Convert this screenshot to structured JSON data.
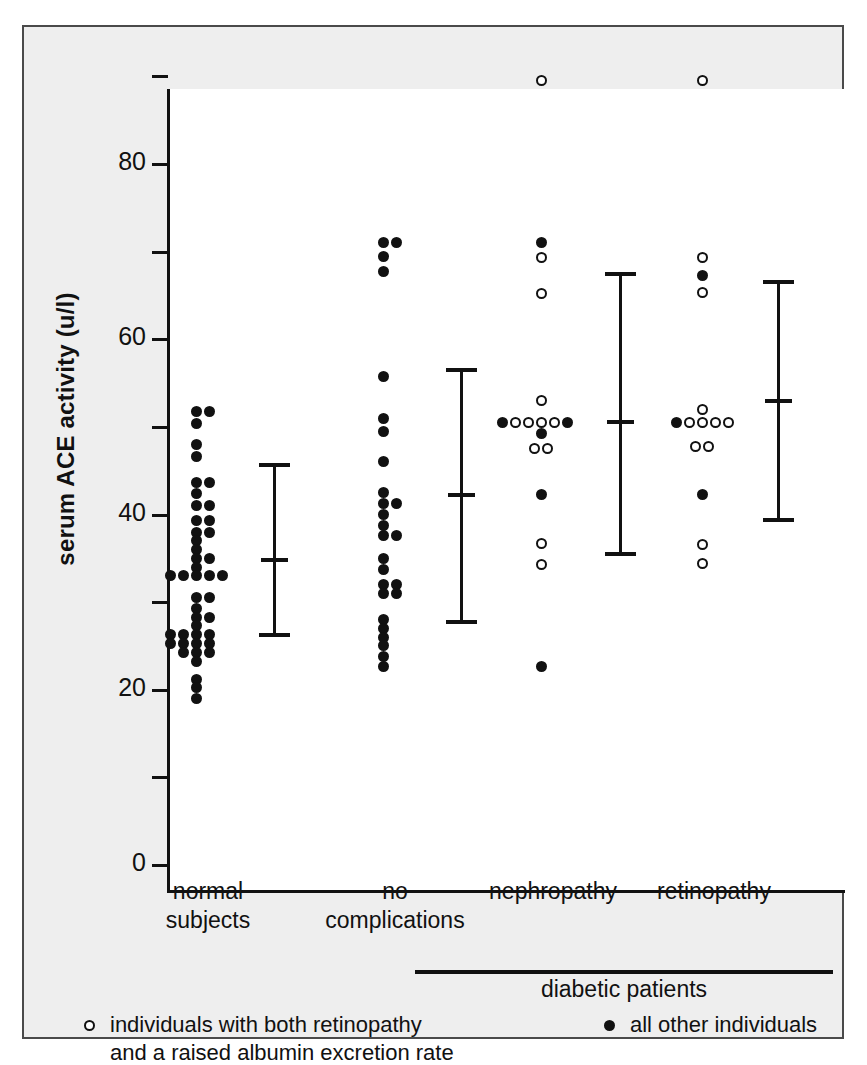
{
  "chart_data": {
    "type": "scatter",
    "title": "",
    "xlabel": "",
    "ylabel": "serum ACE activity (u/l)",
    "ylim": [
      0,
      90
    ],
    "yticks": [
      0,
      10,
      20,
      30,
      40,
      50,
      60,
      70,
      80,
      90
    ],
    "ytick_labels": [
      "0",
      "",
      "20",
      "",
      "40",
      "",
      "60",
      "",
      "80",
      ""
    ],
    "grid": false,
    "legend_position": "bottom",
    "group_bracket_label": "diabetic patients",
    "bracket_groups": [
      "no complications",
      "nephropathy",
      "retinopathy"
    ],
    "legend": [
      {
        "marker": "open-circle",
        "label_line1": "individuals with both retinopathy",
        "label_line2": "and a raised albumin excretion rate"
      },
      {
        "marker": "filled-circle",
        "label_line1": "all other individuals",
        "label_line2": ""
      }
    ],
    "categories": [
      "normal subjects",
      "no complications",
      "nephropathy",
      "retinopathy"
    ],
    "series": [
      {
        "name": "normal subjects",
        "label_line1": "normal",
        "label_line2": "subjects",
        "points": [
          {
            "v": 51.8,
            "marker": "filled",
            "offset": 0
          },
          {
            "v": 51.8,
            "marker": "filled",
            "offset": 1
          },
          {
            "v": 50.4,
            "marker": "filled",
            "offset": 0
          },
          {
            "v": 48.0,
            "marker": "filled",
            "offset": 0
          },
          {
            "v": 46.6,
            "marker": "filled",
            "offset": 0
          },
          {
            "v": 43.7,
            "marker": "filled",
            "offset": 0
          },
          {
            "v": 43.7,
            "marker": "filled",
            "offset": 1
          },
          {
            "v": 42.4,
            "marker": "filled",
            "offset": 0
          },
          {
            "v": 41.0,
            "marker": "filled",
            "offset": 0
          },
          {
            "v": 41.0,
            "marker": "filled",
            "offset": 1
          },
          {
            "v": 39.3,
            "marker": "filled",
            "offset": 0
          },
          {
            "v": 39.3,
            "marker": "filled",
            "offset": 1
          },
          {
            "v": 38.0,
            "marker": "filled",
            "offset": 0
          },
          {
            "v": 38.0,
            "marker": "filled",
            "offset": 1
          },
          {
            "v": 37.0,
            "marker": "filled",
            "offset": 0
          },
          {
            "v": 36.0,
            "marker": "filled",
            "offset": 0
          },
          {
            "v": 35.0,
            "marker": "filled",
            "offset": 0
          },
          {
            "v": 35.0,
            "marker": "filled",
            "offset": 1
          },
          {
            "v": 34.0,
            "marker": "filled",
            "offset": 0
          },
          {
            "v": 33.0,
            "marker": "filled",
            "offset": -2
          },
          {
            "v": 33.0,
            "marker": "filled",
            "offset": -1
          },
          {
            "v": 33.0,
            "marker": "filled",
            "offset": 0
          },
          {
            "v": 33.0,
            "marker": "filled",
            "offset": 1
          },
          {
            "v": 33.0,
            "marker": "filled",
            "offset": 2
          },
          {
            "v": 30.5,
            "marker": "filled",
            "offset": 0
          },
          {
            "v": 30.5,
            "marker": "filled",
            "offset": 1
          },
          {
            "v": 29.3,
            "marker": "filled",
            "offset": 0
          },
          {
            "v": 28.3,
            "marker": "filled",
            "offset": 0
          },
          {
            "v": 28.3,
            "marker": "filled",
            "offset": 1
          },
          {
            "v": 27.3,
            "marker": "filled",
            "offset": 0
          },
          {
            "v": 26.3,
            "marker": "filled",
            "offset": -2
          },
          {
            "v": 26.3,
            "marker": "filled",
            "offset": -1
          },
          {
            "v": 26.3,
            "marker": "filled",
            "offset": 0
          },
          {
            "v": 26.3,
            "marker": "filled",
            "offset": 1
          },
          {
            "v": 25.3,
            "marker": "filled",
            "offset": -2
          },
          {
            "v": 25.3,
            "marker": "filled",
            "offset": -1
          },
          {
            "v": 25.3,
            "marker": "filled",
            "offset": 0
          },
          {
            "v": 25.3,
            "marker": "filled",
            "offset": 1
          },
          {
            "v": 24.2,
            "marker": "filled",
            "offset": -1
          },
          {
            "v": 24.2,
            "marker": "filled",
            "offset": 0
          },
          {
            "v": 24.2,
            "marker": "filled",
            "offset": 1
          },
          {
            "v": 23.2,
            "marker": "filled",
            "offset": 0
          },
          {
            "v": 21.2,
            "marker": "filled",
            "offset": 0
          },
          {
            "v": 20.2,
            "marker": "filled",
            "offset": 0
          },
          {
            "v": 19.0,
            "marker": "filled",
            "offset": 0
          }
        ],
        "errorbar": {
          "upper": 45.6,
          "mean": 34.8,
          "lower": 26.2
        }
      },
      {
        "name": "no complications",
        "label_line1": "no",
        "label_line2": "complications",
        "points": [
          {
            "v": 71.0,
            "marker": "filled",
            "offset": 0
          },
          {
            "v": 71.0,
            "marker": "filled",
            "offset": 1
          },
          {
            "v": 69.5,
            "marker": "filled",
            "offset": 0
          },
          {
            "v": 67.7,
            "marker": "filled",
            "offset": 0
          },
          {
            "v": 55.7,
            "marker": "filled",
            "offset": 0
          },
          {
            "v": 51.0,
            "marker": "filled",
            "offset": 0
          },
          {
            "v": 49.5,
            "marker": "filled",
            "offset": 0
          },
          {
            "v": 46.0,
            "marker": "filled",
            "offset": 0
          },
          {
            "v": 42.5,
            "marker": "filled",
            "offset": 0
          },
          {
            "v": 41.2,
            "marker": "filled",
            "offset": 0
          },
          {
            "v": 41.2,
            "marker": "filled",
            "offset": 1
          },
          {
            "v": 40.0,
            "marker": "filled",
            "offset": 0
          },
          {
            "v": 38.8,
            "marker": "filled",
            "offset": 0
          },
          {
            "v": 37.6,
            "marker": "filled",
            "offset": 0
          },
          {
            "v": 37.6,
            "marker": "filled",
            "offset": 1
          },
          {
            "v": 35.0,
            "marker": "filled",
            "offset": 0
          },
          {
            "v": 33.7,
            "marker": "filled",
            "offset": 0
          },
          {
            "v": 32.0,
            "marker": "filled",
            "offset": 0
          },
          {
            "v": 32.0,
            "marker": "filled",
            "offset": 1
          },
          {
            "v": 31.0,
            "marker": "filled",
            "offset": 0
          },
          {
            "v": 31.0,
            "marker": "filled",
            "offset": 1
          },
          {
            "v": 28.0,
            "marker": "filled",
            "offset": 0
          },
          {
            "v": 27.0,
            "marker": "filled",
            "offset": 0
          },
          {
            "v": 26.0,
            "marker": "filled",
            "offset": 0
          },
          {
            "v": 25.0,
            "marker": "filled",
            "offset": 0
          },
          {
            "v": 23.8,
            "marker": "filled",
            "offset": 0
          },
          {
            "v": 22.7,
            "marker": "filled",
            "offset": 0
          }
        ],
        "errorbar": {
          "upper": 56.5,
          "mean": 42.2,
          "lower": 27.7
        }
      },
      {
        "name": "nephropathy",
        "label_line1": "nephropathy",
        "label_line2": "",
        "points": [
          {
            "v": 89.5,
            "marker": "open",
            "offset": 0
          },
          {
            "v": 71.0,
            "marker": "filled",
            "offset": 0
          },
          {
            "v": 69.3,
            "marker": "open",
            "offset": 0
          },
          {
            "v": 65.2,
            "marker": "open",
            "offset": 0
          },
          {
            "v": 53.0,
            "marker": "open",
            "offset": 0
          },
          {
            "v": 50.5,
            "marker": "filled",
            "offset": -3
          },
          {
            "v": 50.5,
            "marker": "open",
            "offset": -2
          },
          {
            "v": 50.5,
            "marker": "open",
            "offset": -1
          },
          {
            "v": 50.5,
            "marker": "open",
            "offset": 0
          },
          {
            "v": 50.5,
            "marker": "open",
            "offset": 1
          },
          {
            "v": 50.5,
            "marker": "filled",
            "offset": 2
          },
          {
            "v": 49.2,
            "marker": "filled",
            "offset": 0
          },
          {
            "v": 47.5,
            "marker": "open",
            "offset": -0.5
          },
          {
            "v": 47.5,
            "marker": "open",
            "offset": 0.5
          },
          {
            "v": 42.3,
            "marker": "filled",
            "offset": 0
          },
          {
            "v": 36.7,
            "marker": "open",
            "offset": 0
          },
          {
            "v": 34.3,
            "marker": "open",
            "offset": 0
          },
          {
            "v": 22.7,
            "marker": "filled",
            "offset": 0
          }
        ],
        "errorbar": {
          "upper": 67.5,
          "mean": 50.5,
          "lower": 35.5
        }
      },
      {
        "name": "retinopathy",
        "label_line1": "retinopathy",
        "label_line2": "",
        "points": [
          {
            "v": 89.5,
            "marker": "open",
            "offset": 0
          },
          {
            "v": 69.3,
            "marker": "open",
            "offset": 0
          },
          {
            "v": 67.3,
            "marker": "filled",
            "offset": 0
          },
          {
            "v": 65.3,
            "marker": "open",
            "offset": 0
          },
          {
            "v": 52.0,
            "marker": "open",
            "offset": 0
          },
          {
            "v": 50.5,
            "marker": "filled",
            "offset": -2
          },
          {
            "v": 50.5,
            "marker": "open",
            "offset": -1
          },
          {
            "v": 50.5,
            "marker": "open",
            "offset": 0
          },
          {
            "v": 50.5,
            "marker": "open",
            "offset": 1
          },
          {
            "v": 50.5,
            "marker": "open",
            "offset": 2
          },
          {
            "v": 47.8,
            "marker": "open",
            "offset": -0.5
          },
          {
            "v": 47.8,
            "marker": "open",
            "offset": 0.5
          },
          {
            "v": 42.3,
            "marker": "filled",
            "offset": 0
          },
          {
            "v": 36.6,
            "marker": "open",
            "offset": 0
          },
          {
            "v": 34.4,
            "marker": "open",
            "offset": 0
          }
        ],
        "errorbar": {
          "upper": 66.5,
          "mean": 53.0,
          "lower": 39.4
        }
      }
    ]
  }
}
